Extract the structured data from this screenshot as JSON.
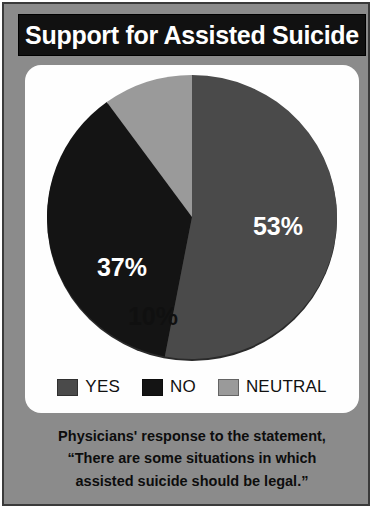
{
  "poster": {
    "title": "Support for Assisted Suicide",
    "frame_color": "#8b8b8b",
    "card_color": "#fefefe",
    "title_bar_color": "#111111",
    "title_text_color": "#ffffff"
  },
  "legend": {
    "items": [
      {
        "label": "YES",
        "color": "#4a4a4a"
      },
      {
        "label": "NO",
        "color": "#141414"
      },
      {
        "label": "NEUTRAL",
        "color": "#9a9a9a"
      }
    ]
  },
  "caption": {
    "lines": [
      "Physicians' response to the statement,",
      "“There are some situations in which",
      "assisted suicide should be legal.”"
    ]
  },
  "chart_data": {
    "type": "pie",
    "title": "Support for Assisted Suicide",
    "subtitle": "Physicians' response to the statement, “There are some situations in which assisted suicide should be legal.”",
    "categories": [
      "YES",
      "NO",
      "NEUTRAL"
    ],
    "values": [
      53,
      37,
      10
    ],
    "value_labels": [
      "53%",
      "37%",
      "10%"
    ],
    "units": "percent",
    "total": 100,
    "colors": [
      "#4a4a4a",
      "#141414",
      "#9a9a9a"
    ],
    "label_text_colors": [
      "#ffffff",
      "#ffffff",
      "#101010"
    ],
    "start_angle_deg": 0,
    "direction": "clockwise",
    "legend_position": "bottom",
    "grid": false,
    "slices": [
      {
        "name": "YES",
        "value": 53,
        "label": "53%",
        "color": "#4a4a4a"
      },
      {
        "name": "NO",
        "value": 37,
        "label": "37%",
        "color": "#141414"
      },
      {
        "name": "NEUTRAL",
        "value": 10,
        "label": "10%",
        "color": "#9a9a9a"
      }
    ]
  }
}
